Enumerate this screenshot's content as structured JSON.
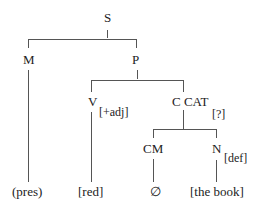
{
  "diagram": {
    "type": "syntax-tree",
    "nodes": {
      "root": {
        "label": "S"
      },
      "m": {
        "label": "M"
      },
      "p": {
        "label": "P"
      },
      "v": {
        "label": "V",
        "feature": "[+adj]"
      },
      "ccat": {
        "label": "C CAT",
        "feature": "[?]"
      },
      "cm": {
        "label": "CM"
      },
      "n": {
        "label": "N",
        "feature": "[def]"
      }
    },
    "leaves": {
      "pres": "(pres)",
      "red": "[red]",
      "empty": "∅",
      "the_book": "[the book]"
    },
    "edges": [
      [
        "S",
        "M"
      ],
      [
        "S",
        "P"
      ],
      [
        "P",
        "V"
      ],
      [
        "P",
        "C CAT"
      ],
      [
        "C CAT",
        "CM"
      ],
      [
        "C CAT",
        "N"
      ],
      [
        "M",
        "(pres)"
      ],
      [
        "V",
        "[red]"
      ],
      [
        "CM",
        "∅"
      ],
      [
        "N",
        "[the book]"
      ]
    ]
  }
}
